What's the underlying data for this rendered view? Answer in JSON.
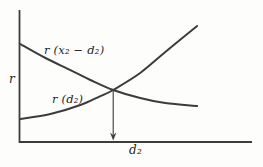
{
  "colors": {
    "background": "#fdfdfc",
    "line": "#3c3c3c",
    "text": "#262626"
  },
  "chart_data": {
    "type": "line",
    "title": "",
    "xlabel": "d₂",
    "ylabel": "r",
    "xlim": [
      0,
      100
    ],
    "ylim": [
      0,
      100
    ],
    "grid": false,
    "legend_position": "labels-on-curves",
    "series": [
      {
        "name": "r (x₂ − d₂)",
        "x": [
          0.4,
          11.2,
          21.9,
          30.5,
          40.3,
          51.9,
          62.7,
          76.4
        ],
        "y": [
          74.2,
          63.6,
          54.5,
          47.0,
          39.4,
          33.3,
          29.5,
          27.3
        ]
      },
      {
        "name": "r (d₂)",
        "x": [
          0.4,
          13.3,
          26.2,
          34.8,
          40.3,
          51.9,
          62.7,
          76.4
        ],
        "y": [
          17.4,
          21.2,
          28.0,
          34.8,
          39.4,
          52.3,
          68.2,
          87.9
        ]
      }
    ],
    "intersection": {
      "x": 40.3,
      "y": 39.4
    },
    "annotations": [
      {
        "type": "arrow",
        "from": {
          "x": 40.3,
          "y": 39.4
        },
        "to": {
          "x": 40.3,
          "y": 0
        }
      }
    ]
  }
}
